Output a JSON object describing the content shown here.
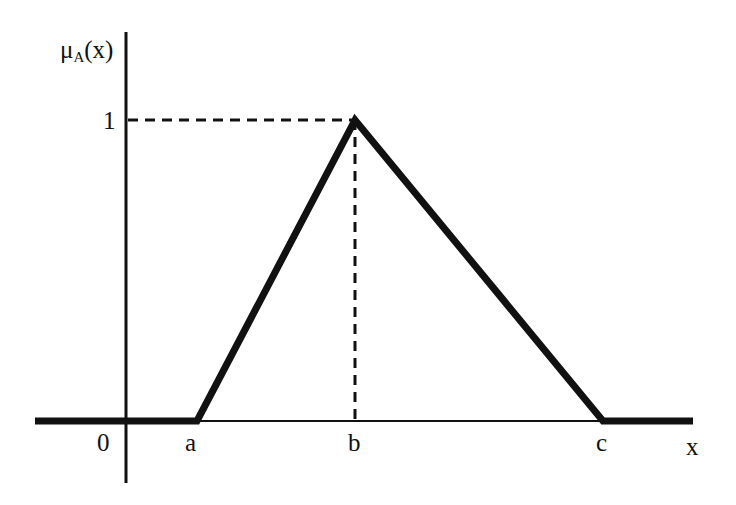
{
  "diagram": {
    "type": "triangular-membership-function",
    "y_axis_label": {
      "main": "μ",
      "subscript": "A",
      "suffix": "(x)"
    },
    "x_axis_label": "x",
    "y_tick_label": "1",
    "origin_label": "0",
    "x_points": [
      {
        "label": "a",
        "role": "left foot"
      },
      {
        "label": "b",
        "role": "peak"
      },
      {
        "label": "c",
        "role": "right foot"
      }
    ],
    "colors": {
      "line": "#111111",
      "background": "#ffffff"
    }
  }
}
